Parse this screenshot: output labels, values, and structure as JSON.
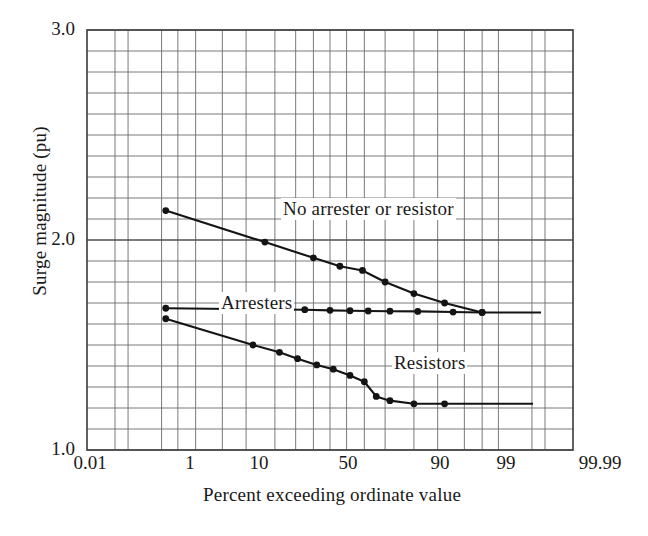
{
  "chart_data": {
    "type": "line",
    "title": "",
    "xlabel": "Percent exceeding ordinate value",
    "ylabel": "Surge magnitude (pu)",
    "x_scale": "probability",
    "xlim": [
      0.01,
      99.99
    ],
    "ylim": [
      1.0,
      3.0
    ],
    "grid": true,
    "legend_position": "inline-annotations",
    "y_ticks": [
      "3.0",
      "2.0",
      "1.0"
    ],
    "y_tick_values": [
      3.0,
      2.0,
      1.0
    ],
    "y_minor_step": 0.1,
    "x_ticks": [
      "0.01",
      "1",
      "10",
      "50",
      "90",
      "99",
      "99.99"
    ],
    "x_tick_values": [
      0.01,
      1,
      10,
      50,
      90,
      99,
      99.99
    ],
    "series": [
      {
        "name": "No arrester or resistor",
        "annotation": "No arrester or resistor",
        "marker": "filled-circle",
        "x": [
          0.6,
          16,
          40,
          56,
          69,
          80,
          90,
          96,
          99
        ],
        "y": [
          2.14,
          1.99,
          1.915,
          1.875,
          1.855,
          1.8,
          1.745,
          1.7,
          1.655
        ],
        "values": [
          2.14,
          1.99,
          1.915,
          1.875,
          1.855,
          1.8,
          1.745,
          1.7,
          1.655
        ]
      },
      {
        "name": "Arresters",
        "annotation": "Arresters",
        "marker": "filled-circle",
        "x": [
          0.6,
          35,
          50,
          62,
          72,
          82,
          91,
          97,
          99
        ],
        "y": [
          1.675,
          1.668,
          1.665,
          1.663,
          1.662,
          1.661,
          1.66,
          1.657,
          1.655
        ],
        "values": [
          1.675,
          1.668,
          1.665,
          1.663,
          1.662,
          1.661,
          1.66,
          1.657,
          1.655
        ]
      },
      {
        "name": "Resistors",
        "annotation": "Resistors",
        "marker": "filled-circle",
        "x": [
          0.6,
          12,
          22,
          31,
          42,
          52,
          62,
          70,
          76,
          82,
          90,
          96
        ],
        "y": [
          1.625,
          1.5,
          1.465,
          1.435,
          1.405,
          1.385,
          1.355,
          1.325,
          1.255,
          1.235,
          1.22,
          1.22
        ],
        "values": [
          1.625,
          1.5,
          1.465,
          1.435,
          1.405,
          1.385,
          1.355,
          1.325,
          1.255,
          1.235,
          1.22,
          1.22
        ]
      }
    ]
  },
  "axes": {
    "y_label": "Surge magnitude (pu)",
    "x_label": "Percent exceeding ordinate value",
    "y_ticks": [
      {
        "label": "3.0",
        "value": 3.0
      },
      {
        "label": "2.0",
        "value": 2.0
      },
      {
        "label": "1.0",
        "value": 1.0
      }
    ],
    "x_ticks": [
      {
        "label": "0.01",
        "value": 0.01
      },
      {
        "label": "1",
        "value": 1
      },
      {
        "label": "10",
        "value": 10
      },
      {
        "label": "50",
        "value": 50
      },
      {
        "label": "90",
        "value": 90
      },
      {
        "label": "99",
        "value": 99
      },
      {
        "label": "99.99",
        "value": 99.99
      }
    ]
  },
  "annotations": {
    "no_arrester": "No arrester or resistor",
    "arresters": "Arresters",
    "resistors": "Resistors"
  },
  "colors": {
    "background": "#ffffff",
    "line": "#141414",
    "grid": "#6b6b6b",
    "frame": "#3a3a3a",
    "text": "#1a1a1a"
  }
}
